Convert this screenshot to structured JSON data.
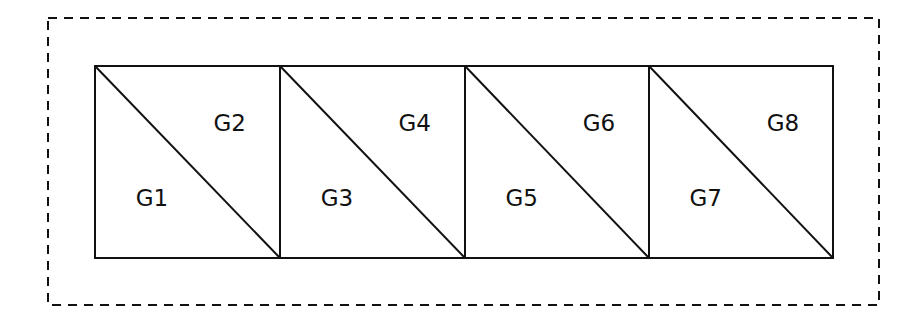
{
  "diagram": {
    "colors": {
      "stroke": "#111111",
      "background": "#ffffff"
    },
    "outer_boundary": {
      "style": "dashed",
      "x": 48,
      "y": 18,
      "width": 831,
      "height": 287
    },
    "strip": {
      "x": 95,
      "y": 66,
      "height": 192,
      "cell_edges": [
        95,
        280,
        465,
        649,
        833
      ]
    },
    "cells": [
      {
        "lower_label": "G1",
        "upper_label": "G2"
      },
      {
        "lower_label": "G3",
        "upper_label": "G4"
      },
      {
        "lower_label": "G5",
        "upper_label": "G6"
      },
      {
        "lower_label": "G7",
        "upper_label": "G8"
      }
    ]
  }
}
